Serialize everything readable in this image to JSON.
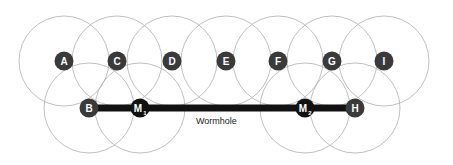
{
  "diagram": {
    "title": "",
    "wormhole_label": "Wormhole",
    "colors": {
      "background": "#ffffff",
      "range_circle": "#b0b0b0",
      "node_fill": "#3a3a3a",
      "malicious_fill": "#111111",
      "tunnel": "#111111",
      "node_text": "#ffffff"
    },
    "range_radius": 45,
    "nodes": [
      {
        "id": "A",
        "label": "A",
        "x": 64,
        "y": 61,
        "type": "normal"
      },
      {
        "id": "C",
        "label": "C",
        "x": 117,
        "y": 61,
        "type": "normal"
      },
      {
        "id": "D",
        "label": "D",
        "x": 172,
        "y": 61,
        "type": "normal"
      },
      {
        "id": "E",
        "label": "E",
        "x": 226,
        "y": 61,
        "type": "normal"
      },
      {
        "id": "F",
        "label": "F",
        "x": 278,
        "y": 61,
        "type": "normal"
      },
      {
        "id": "G",
        "label": "G",
        "x": 332,
        "y": 61,
        "type": "normal"
      },
      {
        "id": "I",
        "label": "I",
        "x": 384,
        "y": 61,
        "type": "normal"
      },
      {
        "id": "B",
        "label": "B",
        "x": 89,
        "y": 108,
        "type": "normal"
      },
      {
        "id": "M1",
        "label": "M",
        "sub": "1",
        "x": 140,
        "y": 108,
        "type": "malicious"
      },
      {
        "id": "M2",
        "label": "M",
        "sub": "2",
        "x": 305,
        "y": 108,
        "type": "malicious"
      },
      {
        "id": "H",
        "label": "H",
        "x": 355,
        "y": 108,
        "type": "normal"
      }
    ],
    "tunnel": {
      "from": "B",
      "to": "H",
      "label": "Wormhole"
    }
  }
}
